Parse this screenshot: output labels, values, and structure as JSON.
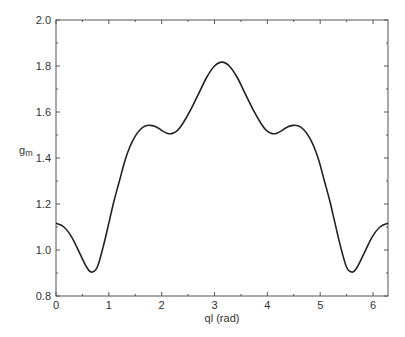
{
  "chart_data": {
    "type": "line",
    "title": "",
    "xlabel": "ql (rad)",
    "ylabel": "g",
    "ylabel_subscript": "m",
    "xlim": [
      0,
      6.2832
    ],
    "ylim": [
      0.8,
      2.0
    ],
    "x_ticks": [
      0,
      1,
      2,
      3,
      4,
      5,
      6
    ],
    "x_tick_labels": [
      "0",
      "1",
      "2",
      "3",
      "4",
      "5",
      "6"
    ],
    "y_ticks": [
      0.8,
      1.0,
      1.2,
      1.4,
      1.6,
      1.8,
      2.0
    ],
    "y_tick_labels": [
      "0.8",
      "1.0",
      "1.2",
      "1.4",
      "1.6",
      "1.8",
      "2.0"
    ],
    "grid": false,
    "legend": null,
    "line_color": "#222222",
    "series": [
      {
        "name": "gm",
        "x": [
          0.0,
          0.15,
          0.3,
          0.45,
          0.58,
          0.67,
          0.78,
          0.9,
          1.0,
          1.1,
          1.2,
          1.3,
          1.4,
          1.5,
          1.6,
          1.7,
          1.79,
          1.9,
          2.0,
          2.1,
          2.19,
          2.3,
          2.4,
          2.55,
          2.7,
          2.85,
          3.0,
          3.1416,
          3.28,
          3.43,
          3.58,
          3.73,
          3.88,
          3.98,
          4.09,
          4.18,
          4.28,
          4.38,
          4.49,
          4.58,
          4.68,
          4.78,
          4.88,
          4.98,
          5.08,
          5.18,
          5.28,
          5.38,
          5.5,
          5.61,
          5.7,
          5.83,
          5.98,
          6.13,
          6.2832
        ],
        "y": [
          1.116,
          1.1,
          1.055,
          0.985,
          0.925,
          0.904,
          0.925,
          1.02,
          1.117,
          1.215,
          1.3,
          1.385,
          1.45,
          1.495,
          1.525,
          1.54,
          1.542,
          1.535,
          1.52,
          1.508,
          1.506,
          1.52,
          1.55,
          1.61,
          1.68,
          1.75,
          1.8,
          1.817,
          1.8,
          1.75,
          1.68,
          1.61,
          1.55,
          1.52,
          1.506,
          1.508,
          1.52,
          1.535,
          1.542,
          1.54,
          1.525,
          1.495,
          1.45,
          1.385,
          1.3,
          1.215,
          1.117,
          1.02,
          0.925,
          0.904,
          0.925,
          0.985,
          1.055,
          1.1,
          1.116
        ]
      }
    ]
  }
}
